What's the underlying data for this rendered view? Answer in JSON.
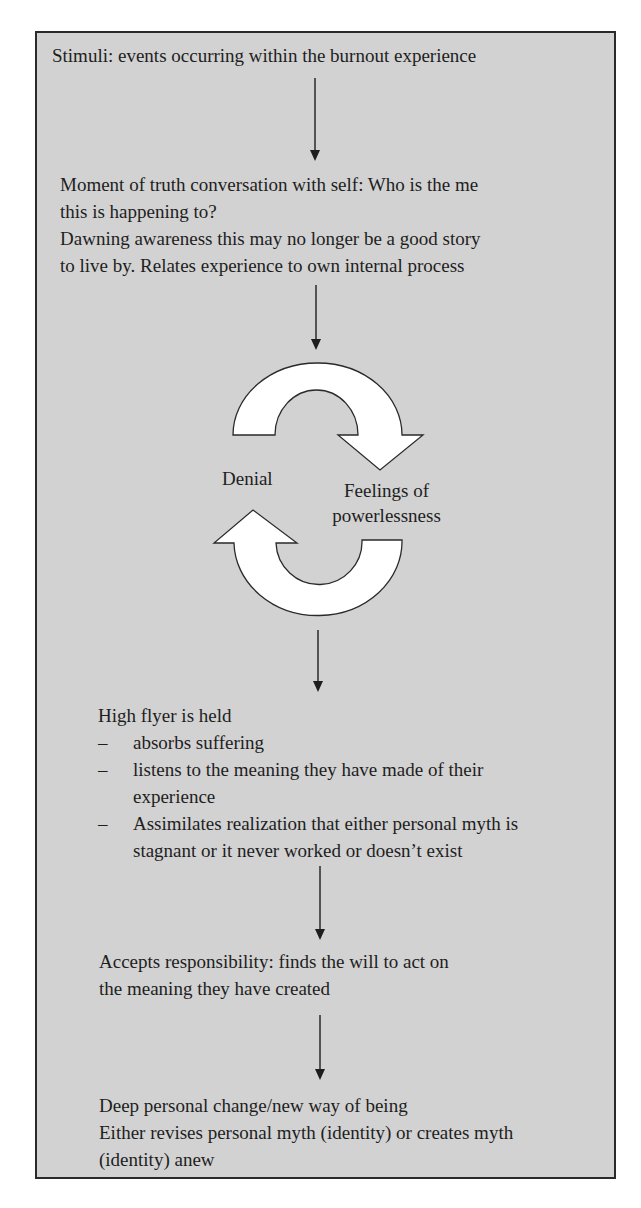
{
  "diagram": {
    "type": "flowchart",
    "background_color": "#d2d2d2",
    "border_color": "#2a2a2a",
    "steps": [
      {
        "id": "stimuli",
        "lines": [
          "Stimuli: events occurring within the burnout experience"
        ]
      },
      {
        "id": "moment-of-truth",
        "lines": [
          "Moment of truth conversation with self: Who is the me",
          "this is happening to?",
          "Dawning awareness this may no longer be a good story",
          "to live by. Relates experience to own internal process"
        ]
      },
      {
        "id": "cycle",
        "left_label": "Denial",
        "right_label_lines": [
          "Feelings of",
          "powerlessness"
        ]
      },
      {
        "id": "held",
        "heading": "High flyer is held",
        "bullet_marker": "–",
        "bullets": [
          {
            "lines": [
              "absorbs suffering"
            ]
          },
          {
            "lines": [
              "listens to the meaning they have made of  their",
              "experience"
            ]
          },
          {
            "lines": [
              "Assimilates realization that either personal myth is",
              "stagnant or it never worked or doesn’t exist"
            ]
          }
        ]
      },
      {
        "id": "accepts",
        "lines": [
          "Accepts responsibility: finds the will to act on",
          "the meaning they have created"
        ]
      },
      {
        "id": "change",
        "lines": [
          "Deep personal change/new way of being",
          "Either revises personal myth (identity) or creates myth",
          "(identity) anew"
        ]
      }
    ],
    "connectors": [
      {
        "from": "stimuli",
        "to": "moment-of-truth",
        "icon": "arrow-down"
      },
      {
        "from": "moment-of-truth",
        "to": "cycle",
        "icon": "arrow-down"
      },
      {
        "from": "cycle",
        "to": "held",
        "icon": "arrow-down"
      },
      {
        "from": "held",
        "to": "accepts",
        "icon": "arrow-down"
      },
      {
        "from": "accepts",
        "to": "change",
        "icon": "arrow-down"
      }
    ]
  }
}
